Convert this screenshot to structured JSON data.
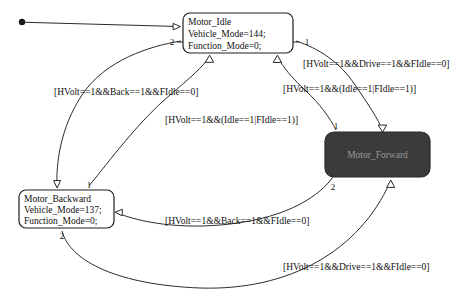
{
  "diagram": {
    "background": "#ffffff",
    "line_color": "#2b2b2b",
    "active_state_fill": "#3b3b3b",
    "active_state_text_color": "#9a9a9a"
  },
  "initial": {
    "marker_name": "initial-state-dot",
    "target": "Motor_Idle"
  },
  "states": [
    {
      "id": "motor-idle",
      "name": "Motor_Idle",
      "lines": [
        "Motor_Idle",
        "Vehicle_Mode=144;",
        "Function_Mode=0;"
      ],
      "highlighted": false,
      "ports": [
        {
          "label": "2",
          "position": "left"
        },
        {
          "label": "1",
          "position": "right"
        }
      ]
    },
    {
      "id": "motor-backward",
      "name": "Motor_Backward",
      "lines": [
        "Motor_Backward",
        "Vehicle_Mode=137;",
        "Function_Mode=0;"
      ],
      "highlighted": false,
      "ports": [
        {
          "label": "1",
          "position": "top-right"
        },
        {
          "label": "2",
          "position": "bottom"
        }
      ]
    },
    {
      "id": "motor-forward",
      "name": "Motor_Forward",
      "lines": [
        "Motor_Forward"
      ],
      "highlighted": true,
      "ports": [
        {
          "label": "1",
          "position": "top-left"
        },
        {
          "label": "2",
          "position": "bottom-left"
        }
      ]
    }
  ],
  "transitions": [
    {
      "id": "idle-to-backward",
      "from": "Motor_Idle",
      "to": "Motor_Backward",
      "guard": "[HVolt==1&&Back==1&&FIdle==0]"
    },
    {
      "id": "backward-to-idle",
      "from": "Motor_Backward",
      "to": "Motor_Idle",
      "guard": "[HVolt==1&&(Idle==1|FIdle==1)]"
    },
    {
      "id": "idle-to-forward",
      "from": "Motor_Idle",
      "to": "Motor_Forward",
      "guard": "[HVolt==1&&Drive==1&&FIdle==0]"
    },
    {
      "id": "forward-to-idle",
      "from": "Motor_Forward",
      "to": "Motor_Idle",
      "guard": "[HVolt==1&&(Idle==1|FIdle==1)]"
    },
    {
      "id": "forward-to-backward",
      "from": "Motor_Forward",
      "to": "Motor_Backward",
      "guard": "[HVolt==1&&Back==1&&FIdle==0]"
    },
    {
      "id": "backward-to-forward",
      "from": "Motor_Backward",
      "to": "Motor_Forward",
      "guard": "[HVolt==1&&Drive==1&&FIdle==0]"
    }
  ]
}
